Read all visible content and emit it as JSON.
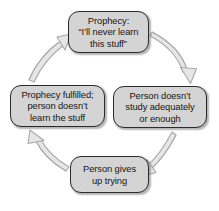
{
  "diagram": {
    "type": "cycle-diagram",
    "direction": "clockwise",
    "style": {
      "node_fill": "#d4d4d4",
      "node_border": "#2b2b2b",
      "arrow_fill": "#e6e6e6",
      "arrow_stroke": "#a8a8a8",
      "text_color": "#161616",
      "background": "#ffffff"
    },
    "nodes": [
      {
        "id": "prophecy",
        "position": "top",
        "lines": [
          "Prophecy:",
          "“I’ll never learn",
          "this stuff”"
        ],
        "text": "Prophecy: “I’ll never learn this stuff”"
      },
      {
        "id": "no-study",
        "position": "right",
        "lines": [
          "Person doesn’t",
          "study adequately",
          "or enough"
        ],
        "text": "Person doesn’t study adequately or enough"
      },
      {
        "id": "gives-up",
        "position": "bottom",
        "lines": [
          "Person gives",
          "up trying"
        ],
        "text": "Person gives up trying"
      },
      {
        "id": "fulfilled",
        "position": "left",
        "lines": [
          "Prophecy fulfilled;",
          "person doesn’t",
          "learn the stuff"
        ],
        "text": "Prophecy fulfilled; person doesn’t learn the stuff"
      }
    ],
    "arrows": [
      {
        "id": "arrow-prophecy-to-nostudy",
        "from": "prophecy",
        "to": "no-study",
        "shape": "curved"
      },
      {
        "id": "arrow-nostudy-to-givesup",
        "from": "no-study",
        "to": "gives-up",
        "shape": "curved"
      },
      {
        "id": "arrow-givesup-to-fulfilled",
        "from": "gives-up",
        "to": "fulfilled",
        "shape": "curved"
      },
      {
        "id": "arrow-fulfilled-to-prophecy",
        "from": "fulfilled",
        "to": "prophecy",
        "shape": "curved"
      }
    ]
  }
}
